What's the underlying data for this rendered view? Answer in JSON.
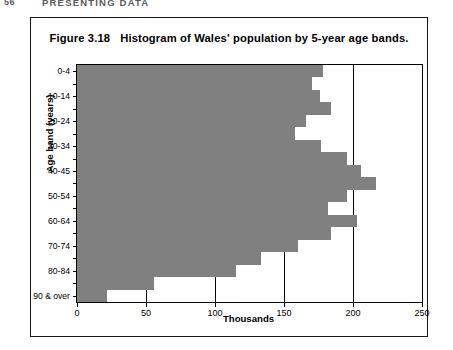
{
  "page": {
    "folio": "56",
    "running_title": "PRESENTING DATA"
  },
  "figure": {
    "caption_number": "Figure 3.18",
    "caption_text": "Histogram of Wales' population by 5-year age bands."
  },
  "colors": {
    "bar_fill": "#808080",
    "axis": "#000000",
    "border": "#1a1a1a",
    "background": "#ffffff"
  },
  "chart_data": {
    "type": "bar",
    "orientation": "horizontal",
    "title": "Histogram of Wales' population by 5-year age bands.",
    "xlabel": "Thousands",
    "ylabel": "Age band (years)",
    "xlim": [
      0,
      250
    ],
    "xticks": [
      0,
      50,
      100,
      150,
      200,
      250
    ],
    "xticklabels": [
      "0",
      "50",
      "100",
      "150",
      "200",
      "250"
    ],
    "grid": "vertical",
    "legend": "none",
    "categories": [
      "0-4",
      "5-9",
      "10-14",
      "15-19",
      "20-24",
      "25-29",
      "30-34",
      "35-39",
      "40-45",
      "45-49",
      "50-54",
      "55-59",
      "60-64",
      "65-69",
      "70-74",
      "75-79",
      "80-84",
      "85-89",
      "90 & over"
    ],
    "visible_yticklabels": [
      "0-4",
      "10-14",
      "20-24",
      "30-34",
      "40-45",
      "50-54",
      "60-64",
      "70-74",
      "80-84",
      "90 & over"
    ],
    "values": [
      178,
      170,
      176,
      184,
      166,
      158,
      177,
      196,
      206,
      217,
      196,
      182,
      203,
      184,
      160,
      133,
      115,
      56,
      22
    ],
    "units": "thousands"
  }
}
